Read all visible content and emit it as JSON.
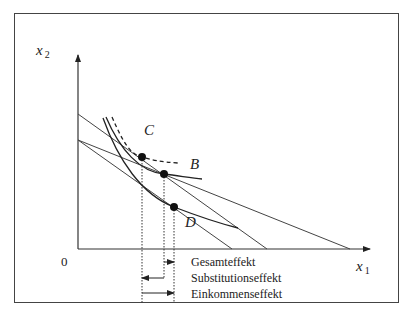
{
  "diagram": {
    "type": "indifference-curve income and substitution effect",
    "axes": {
      "x_label": "x",
      "x_sub": "1",
      "y_label": "x",
      "y_sub": "2",
      "origin": "0"
    },
    "points": [
      {
        "label": "C",
        "x": 142,
        "y": 157
      },
      {
        "label": "B",
        "x": 164,
        "y": 174
      },
      {
        "label": "D",
        "x": 174,
        "y": 207
      }
    ],
    "effects": [
      {
        "label": "Gesamteffekt",
        "from": "B",
        "to": "D",
        "direction": "right"
      },
      {
        "label": "Substitutionseffekt",
        "from": "B",
        "to": "C",
        "direction": "left"
      },
      {
        "label": "Einkommenseffekt",
        "from": "C",
        "to": "D",
        "direction": "right"
      }
    ],
    "colors": {
      "line": "#333333",
      "frame": "#444444",
      "background": "#ffffff"
    }
  }
}
